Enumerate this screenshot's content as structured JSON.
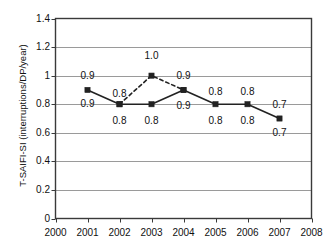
{
  "chart_data": {
    "type": "line",
    "title": "",
    "xlabel": "",
    "ylabel": "T-SAIFI-SI (interruptions/DP/year)",
    "x": [
      2000,
      2001,
      2002,
      2003,
      2004,
      2005,
      2006,
      2007,
      2008
    ],
    "xtick_labels": [
      "2000",
      "2001",
      "2002",
      "2003",
      "2004",
      "2005",
      "2006",
      "2007",
      "2008"
    ],
    "xlim": [
      2000,
      2008
    ],
    "ylim": [
      0,
      1.4
    ],
    "ytick_labels": [
      "0",
      "0.2",
      "0.4",
      "0.6",
      "0.8",
      "1",
      "1.2",
      "1.4"
    ],
    "ytick_values": [
      0,
      0.2,
      0.4,
      0.6,
      0.8,
      1.0,
      1.2,
      1.4
    ],
    "grid": true,
    "grid_axis": "y",
    "legend": "none",
    "series": [
      {
        "name": "solid-series",
        "style": "solid",
        "marker": "square",
        "color": "#222222",
        "x": [
          2001,
          2002,
          2003,
          2004,
          2005,
          2006,
          2007
        ],
        "values": [
          0.9,
          0.8,
          0.8,
          0.9,
          0.8,
          0.8,
          0.7
        ]
      },
      {
        "name": "dashed-series",
        "style": "dashed",
        "marker": "square",
        "color": "#222222",
        "x": [
          2002,
          2003,
          2004
        ],
        "values": [
          0.8,
          1.0,
          0.9
        ]
      }
    ],
    "annotations": [
      {
        "name": "label-2001-above",
        "x": 2001,
        "y": 1.0,
        "text": "0.9"
      },
      {
        "name": "label-2001-below",
        "x": 2001,
        "y": 0.8,
        "text": "0.9"
      },
      {
        "name": "label-2002-above",
        "x": 2002,
        "y": 0.875,
        "text": "0.8"
      },
      {
        "name": "label-2002-below",
        "x": 2002,
        "y": 0.685,
        "text": "0.8"
      },
      {
        "name": "label-2003-dashed-above",
        "x": 2003,
        "y": 1.135,
        "text": "1.0"
      },
      {
        "name": "label-2003-below",
        "x": 2003,
        "y": 0.685,
        "text": "0.8"
      },
      {
        "name": "label-2004-above",
        "x": 2004,
        "y": 1.0,
        "text": "0.9"
      },
      {
        "name": "label-2004-below",
        "x": 2004,
        "y": 0.79,
        "text": "0.9"
      },
      {
        "name": "label-2005-above",
        "x": 2005,
        "y": 0.885,
        "text": "0.8"
      },
      {
        "name": "label-2005-below",
        "x": 2005,
        "y": 0.685,
        "text": "0.8"
      },
      {
        "name": "label-2006-above",
        "x": 2006,
        "y": 0.885,
        "text": "0.8"
      },
      {
        "name": "label-2006-below",
        "x": 2006,
        "y": 0.685,
        "text": "0.8"
      },
      {
        "name": "label-2007-above",
        "x": 2007,
        "y": 0.795,
        "text": "0.7"
      },
      {
        "name": "label-2007-below",
        "x": 2007,
        "y": 0.6,
        "text": "0.7"
      }
    ]
  }
}
